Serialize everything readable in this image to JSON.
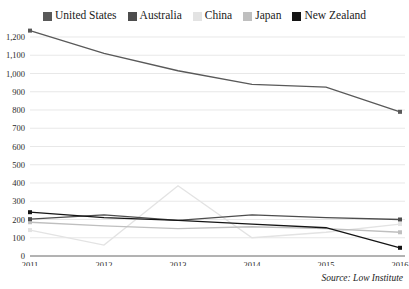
{
  "legend": {
    "position": "top-center",
    "items": [
      {
        "label": "United States",
        "color": "#595959",
        "swatch": "legend-swatch-united-states"
      },
      {
        "label": "Australia",
        "color": "#4d4d4d",
        "swatch": "legend-swatch-australia"
      },
      {
        "label": "China",
        "color": "#e3e3e3",
        "swatch": "legend-swatch-china"
      },
      {
        "label": "Japan",
        "color": "#bfbfbf",
        "swatch": "legend-swatch-japan"
      },
      {
        "label": "New Zealand",
        "color": "#141414",
        "swatch": "legend-swatch-new-zealand"
      }
    ]
  },
  "source": {
    "text": "Source: Low Institute"
  },
  "axes": {
    "y_ticks": [
      "0",
      "100",
      "200",
      "300",
      "400",
      "500",
      "600",
      "700",
      "800",
      "900",
      "1,000",
      "1,100",
      "1,200"
    ],
    "x_ticks": [
      "2011",
      "2012",
      "2013",
      "2014",
      "2015",
      "2016"
    ]
  },
  "chart_data": {
    "type": "line",
    "title": "",
    "subtitle": "",
    "xlabel": "",
    "ylabel": "",
    "x": [
      2011,
      2012,
      2013,
      2014,
      2015,
      2016
    ],
    "categories": [
      "2011",
      "2012",
      "2013",
      "2014",
      "2015",
      "2016"
    ],
    "ylim": [
      0,
      1200
    ],
    "ytick_step": 100,
    "ytick_values": [
      0,
      100,
      200,
      300,
      400,
      500,
      600,
      700,
      800,
      900,
      1000,
      1100,
      1200
    ],
    "ytick_labels": [
      "0",
      "100",
      "200",
      "300",
      "400",
      "500",
      "600",
      "700",
      "800",
      "900",
      "1,000",
      "1,100",
      "1,200"
    ],
    "grid": true,
    "grid_axis": "y",
    "legend_position": "top-center",
    "annotation": "Source: Low Institute",
    "series": [
      {
        "name": "United States",
        "color": "#595959",
        "values": [
          1235,
          1110,
          1015,
          940,
          925,
          790
        ]
      },
      {
        "name": "Australia",
        "color": "#4d4d4d",
        "values": [
          202,
          225,
          195,
          225,
          210,
          200
        ]
      },
      {
        "name": "China",
        "color": "#e3e3e3",
        "values": [
          142,
          60,
          385,
          100,
          130,
          175
        ]
      },
      {
        "name": "Japan",
        "color": "#bfbfbf",
        "values": [
          185,
          165,
          150,
          160,
          150,
          130
        ]
      },
      {
        "name": "New Zealand",
        "color": "#141414",
        "values": [
          240,
          210,
          195,
          175,
          155,
          45
        ]
      }
    ]
  }
}
